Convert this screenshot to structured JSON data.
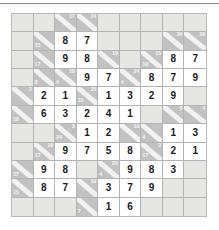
{
  "puzzle": {
    "name": "Kakuro cross-sum puzzle",
    "rows": 9,
    "cols": 9,
    "colors": {
      "page_background": "#ffffff",
      "blank_cell": "#e6e6e2",
      "clue_cell": "#c2c2c2",
      "answer_cell": "#ffffff",
      "grid_line": "#b4b4b4",
      "digit_text": "#1a1a1a",
      "clue_text": "#f4f4f4"
    },
    "legend": {
      "clue_down_label": "down sum (upper-right of diagonal)",
      "clue_across_label": "across sum (lower-left of diagonal)"
    },
    "cells": [
      [
        {
          "type": "blank"
        },
        {
          "type": "blank"
        },
        {
          "type": "clue",
          "down": "17",
          "across": ""
        },
        {
          "type": "clue",
          "down": "24",
          "across": ""
        },
        {
          "type": "blank"
        },
        {
          "type": "blank"
        },
        {
          "type": "blank"
        },
        {
          "type": "blank"
        },
        {
          "type": "blank"
        }
      ],
      [
        {
          "type": "blank"
        },
        {
          "type": "clue",
          "down": "",
          "across": "15"
        },
        {
          "type": "answer",
          "value": "8"
        },
        {
          "type": "answer",
          "value": "7"
        },
        {
          "type": "blank"
        },
        {
          "type": "blank"
        },
        {
          "type": "blank"
        },
        {
          "type": "clue",
          "down": "24",
          "across": ""
        },
        {
          "type": "clue",
          "down": "16",
          "across": ""
        }
      ],
      [
        {
          "type": "blank"
        },
        {
          "type": "clue",
          "down": "",
          "across": "17"
        },
        {
          "type": "answer",
          "value": "9"
        },
        {
          "type": "answer",
          "value": "8"
        },
        {
          "type": "clue",
          "down": "19",
          "across": ""
        },
        {
          "type": "blank"
        },
        {
          "type": "clue",
          "down": "15",
          "across": "10"
        },
        {
          "type": "answer",
          "value": "8"
        },
        {
          "type": "answer",
          "value": "7"
        }
      ],
      [
        {
          "type": "blank"
        },
        {
          "type": "clue",
          "down": "",
          "across": "8"
        },
        {
          "type": "clue",
          "down": "16",
          "across": "4"
        },
        {
          "type": "answer",
          "value": "9"
        },
        {
          "type": "answer",
          "value": "7"
        },
        {
          "type": "clue",
          "down": "24",
          "across": "4"
        },
        {
          "type": "answer",
          "value": "8"
        },
        {
          "type": "answer",
          "value": "7"
        },
        {
          "type": "answer",
          "value": "9"
        }
      ],
      [
        {
          "type": "clue",
          "down": "3",
          "across": ""
        },
        {
          "type": "answer",
          "value": "2"
        },
        {
          "type": "answer",
          "value": "1"
        },
        {
          "type": "clue",
          "down": "15",
          "across": "10"
        },
        {
          "type": "answer",
          "value": "1"
        },
        {
          "type": "answer",
          "value": "3"
        },
        {
          "type": "answer",
          "value": "2"
        },
        {
          "type": "answer",
          "value": "9"
        },
        {
          "type": "blank"
        }
      ],
      [
        {
          "type": "clue",
          "down": "",
          "across": "16"
        },
        {
          "type": "answer",
          "value": "6"
        },
        {
          "type": "answer",
          "value": "3"
        },
        {
          "type": "answer",
          "value": "2"
        },
        {
          "type": "answer",
          "value": "4"
        },
        {
          "type": "answer",
          "value": "1"
        },
        {
          "type": "blank"
        },
        {
          "type": "clue",
          "down": "6",
          "across": ""
        },
        {
          "type": "clue",
          "down": "4",
          "across": ""
        }
      ],
      [
        {
          "type": "blank"
        },
        {
          "type": "blank"
        },
        {
          "type": "clue",
          "down": "3",
          "across": "24"
        },
        {
          "type": "answer",
          "value": "1"
        },
        {
          "type": "answer",
          "value": "2"
        },
        {
          "type": "clue",
          "down": "10",
          "across": ""
        },
        {
          "type": "clue",
          "down": "",
          "across": "4"
        },
        {
          "type": "answer",
          "value": "1"
        },
        {
          "type": "answer",
          "value": "3"
        }
      ],
      [
        {
          "type": "blank"
        },
        {
          "type": "clue",
          "down": "29",
          "across": "17"
        },
        {
          "type": "answer",
          "value": "9"
        },
        {
          "type": "answer",
          "value": "7"
        },
        {
          "type": "answer",
          "value": "5"
        },
        {
          "type": "answer",
          "value": "8"
        },
        {
          "type": "clue",
          "down": "3",
          "across": "17"
        },
        {
          "type": "answer",
          "value": "2"
        },
        {
          "type": "answer",
          "value": "1"
        }
      ],
      [
        {
          "type": "clue",
          "down": "",
          "across": "17"
        },
        {
          "type": "answer",
          "value": "9"
        },
        {
          "type": "answer",
          "value": "8"
        },
        {
          "type": "blank"
        },
        {
          "type": "clue",
          "down": "20",
          "across": "4"
        },
        {
          "type": "answer",
          "value": "9"
        },
        {
          "type": "answer",
          "value": "8"
        },
        {
          "type": "answer",
          "value": "3"
        },
        {
          "type": "blank"
        }
      ]
    ],
    "extra_rows": [
      [
        {
          "type": "clue",
          "down": "",
          "across": "15"
        },
        {
          "type": "answer",
          "value": "8"
        },
        {
          "type": "answer",
          "value": "7"
        },
        {
          "type": "clue",
          "down": "19",
          "across": ""
        },
        {
          "type": "answer",
          "value": "3"
        },
        {
          "type": "answer",
          "value": "7"
        },
        {
          "type": "answer",
          "value": "9"
        },
        {
          "type": "blank"
        },
        {
          "type": "blank"
        }
      ],
      [
        {
          "type": "blank"
        },
        {
          "type": "blank"
        },
        {
          "type": "blank"
        },
        {
          "type": "clue",
          "down": "",
          "across": "7"
        },
        {
          "type": "answer",
          "value": "1"
        },
        {
          "type": "answer",
          "value": "6"
        },
        {
          "type": "blank"
        },
        {
          "type": "blank"
        },
        {
          "type": "blank"
        }
      ]
    ]
  }
}
